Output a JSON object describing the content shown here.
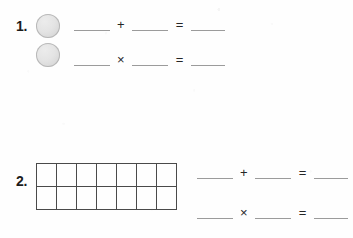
{
  "worksheet": {
    "background_color": "#fefefe",
    "ink_color": "#1b1b1b",
    "blank_line_color": "#9b9b9b",
    "grid_line_color": "#4a4a4a",
    "counter_fill_color": "#e4e4e4"
  },
  "problems": [
    {
      "number": "1.",
      "manipulative": {
        "type": "counters",
        "shape": "circle",
        "count": 2,
        "arrangement": "vertical-stack"
      },
      "equations": [
        {
          "operator": "+",
          "equals": "=",
          "operand_a": "",
          "operand_b": "",
          "result": ""
        },
        {
          "operator": "×",
          "equals": "=",
          "operand_a": "",
          "operand_b": "",
          "result": ""
        }
      ]
    },
    {
      "number": "2.",
      "manipulative": {
        "type": "grid",
        "columns": 7,
        "rows": 2,
        "cells_filled": 0
      },
      "equations": [
        {
          "operator": "+",
          "equals": "=",
          "operand_a": "",
          "operand_b": "",
          "result": ""
        },
        {
          "operator": "×",
          "equals": "=",
          "operand_a": "",
          "operand_b": "",
          "result": ""
        }
      ]
    }
  ]
}
